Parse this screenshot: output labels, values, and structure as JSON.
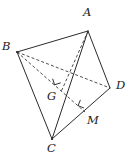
{
  "figure": {
    "name": "tetrahedron-abcd-with-foot-points",
    "type": "geometric-solid-diagram",
    "width": 133,
    "height": 163,
    "background_color": "#ffffff",
    "stroke_color": "#2b2b2b",
    "label_color": "#1a1a1a",
    "solid_stroke_width": 1.0,
    "dashed_stroke_width": 0.9,
    "dash_pattern": "3,2.2"
  },
  "points": [
    {
      "id": "A",
      "label": "A",
      "x": 88,
      "y": 31,
      "label_x": 83,
      "label_y": 7,
      "visible_dot": false
    },
    {
      "id": "B",
      "label": "B",
      "x": 17,
      "y": 52,
      "label_x": 2,
      "label_y": 41,
      "visible_dot": true
    },
    {
      "id": "C",
      "label": "C",
      "x": 52,
      "y": 139,
      "label_x": 47,
      "label_y": 143,
      "visible_dot": true
    },
    {
      "id": "D",
      "label": "D",
      "x": 110,
      "y": 88,
      "label_x": 116,
      "label_y": 80,
      "visible_dot": false
    },
    {
      "id": "G",
      "label": "G",
      "x": 61,
      "y": 92,
      "label_x": 47,
      "label_y": 91,
      "visible_dot": false
    },
    {
      "id": "M",
      "label": "M",
      "x": 85,
      "y": 112,
      "label_x": 87,
      "label_y": 115,
      "visible_dot": false
    }
  ],
  "edges": [
    {
      "id": "AB",
      "from": "A",
      "to": "B",
      "style": "solid",
      "name": "edge-a-b"
    },
    {
      "id": "AC",
      "from": "A",
      "to": "C",
      "style": "solid",
      "name": "edge-a-c"
    },
    {
      "id": "AD",
      "from": "A",
      "to": "D",
      "style": "solid",
      "name": "edge-a-d"
    },
    {
      "id": "BC",
      "from": "B",
      "to": "C",
      "style": "solid",
      "name": "edge-b-c"
    },
    {
      "id": "CD",
      "from": "C",
      "to": "D",
      "style": "solid",
      "name": "edge-c-d"
    },
    {
      "id": "BD",
      "from": "B",
      "to": "D",
      "style": "dashed",
      "name": "edge-b-d"
    },
    {
      "id": "BM",
      "from": "B",
      "to": "M",
      "style": "dashed",
      "name": "edge-b-m-through-g"
    },
    {
      "id": "AG",
      "from": "A",
      "to": "G",
      "style": "dashed",
      "name": "segment-a-g"
    }
  ],
  "right_angles": [
    {
      "id": "at-G",
      "at": "G",
      "name": "right-angle-mark-g",
      "cx": 60,
      "cy": 82,
      "rotation": -18
    },
    {
      "id": "at-M",
      "at": "M",
      "name": "right-angle-mark-m",
      "cx": 84,
      "cy": 107,
      "rotation": 22
    }
  ],
  "notes": {
    "description": "Tetrahedron ABCD; G is the foot of the perpendicular from A, M lies on CD with BM perpendicular to CD."
  }
}
